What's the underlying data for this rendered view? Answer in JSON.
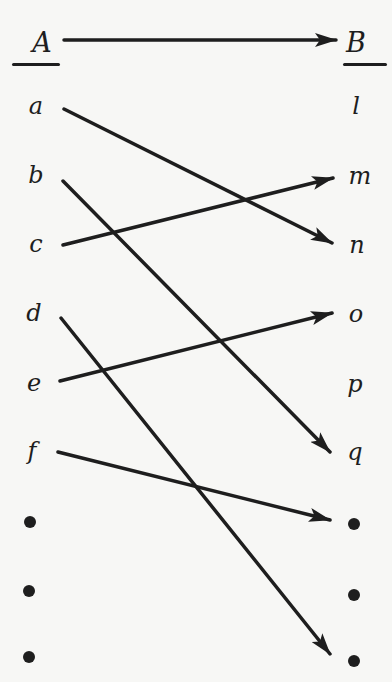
{
  "diagram": {
    "set_a": {
      "title": "A",
      "elements": [
        "a",
        "b",
        "c",
        "d",
        "e",
        "f",
        "•",
        "•",
        "•"
      ]
    },
    "set_b": {
      "title": "B",
      "elements": [
        "l",
        "m",
        "n",
        "o",
        "p",
        "q",
        "•",
        "•",
        "•"
      ]
    },
    "mapping_arrow": {
      "from": "A",
      "to": "B"
    },
    "edges": [
      {
        "from": "a",
        "to": "n"
      },
      {
        "from": "b",
        "to": "q"
      },
      {
        "from": "c",
        "to": "m"
      },
      {
        "from": "d",
        "to": "• (9th)"
      },
      {
        "from": "e",
        "to": "o"
      },
      {
        "from": "f",
        "to": "• (7th)"
      }
    ],
    "line_color": "#1e1e1e",
    "background_color": "#f7f7f5"
  }
}
